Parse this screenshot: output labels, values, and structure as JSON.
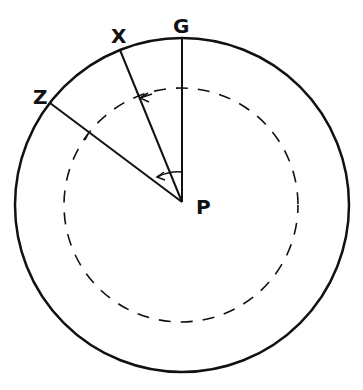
{
  "diagram": {
    "stroke_color": "#111111",
    "background": "#ffffff",
    "outer_circle": {
      "cx": 182,
      "cy": 205,
      "r": 167
    },
    "dashed_circle": {
      "cx": 181,
      "cy": 205,
      "r": 117
    },
    "center": {
      "label": "P",
      "x": 182,
      "y": 202
    },
    "lines": [
      {
        "label": "G",
        "x1": 182,
        "y1": 38,
        "x2": 182,
        "y2": 202
      },
      {
        "label": "X",
        "x1": 120,
        "y1": 50,
        "x2": 182,
        "y2": 202
      },
      {
        "label": "Z",
        "x1": 50,
        "y1": 103,
        "x2": 182,
        "y2": 202
      }
    ],
    "labels": {
      "G": "G",
      "X": "X",
      "Z": "Z",
      "P": "P"
    },
    "arrows": [
      {
        "name": "inner-angle-arrow",
        "from": "G",
        "to": "X"
      },
      {
        "name": "dashed-arc-arrow",
        "from": "G",
        "to": "X"
      }
    ]
  }
}
